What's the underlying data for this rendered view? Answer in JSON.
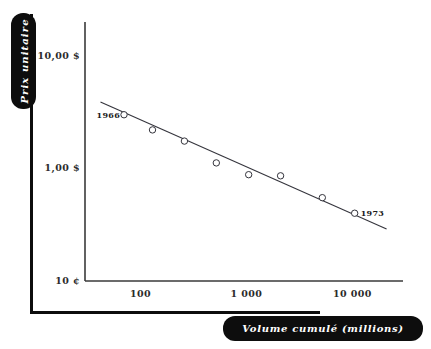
{
  "figure": {
    "y_axis_tab_label": "Prix unitaire",
    "x_axis_tab_label": "Volume cumulé (millions)"
  },
  "chart_data": {
    "type": "scatter",
    "title": "",
    "subtitle": "",
    "xlabel": "Volume cumulé (millions)",
    "ylabel": "Prix unitaire",
    "xscale": "log",
    "yscale": "log",
    "grid": false,
    "legend": false,
    "xlim": [
      30,
      30000
    ],
    "ylim": [
      0.1,
      20
    ],
    "xtick_labels": [
      "100",
      "1 000",
      "10 000"
    ],
    "xtick_values": [
      100,
      1000,
      10000
    ],
    "ytick_labels": [
      "10,00 $",
      "1,00 $",
      "10 ¢"
    ],
    "ytick_values": [
      10,
      1,
      0.1
    ],
    "series": [
      {
        "name": "Prix unitaire observé",
        "marker": "open-circle",
        "x": [
          70,
          130,
          260,
          520,
          1050,
          2100,
          5200,
          10500
        ],
        "y": [
          3.0,
          2.2,
          1.75,
          1.12,
          0.88,
          0.86,
          0.55,
          0.4
        ]
      }
    ],
    "trendline": {
      "name": "Courbe d'expérience",
      "x_start": 42,
      "y_start": 3.9,
      "x_end": 21000,
      "y_end": 0.29
    },
    "annotations": [
      {
        "text": "1966",
        "x": 70,
        "y": 3.0,
        "position": "left"
      },
      {
        "text": "1973",
        "x": 10500,
        "y": 0.4,
        "position": "right"
      }
    ]
  }
}
